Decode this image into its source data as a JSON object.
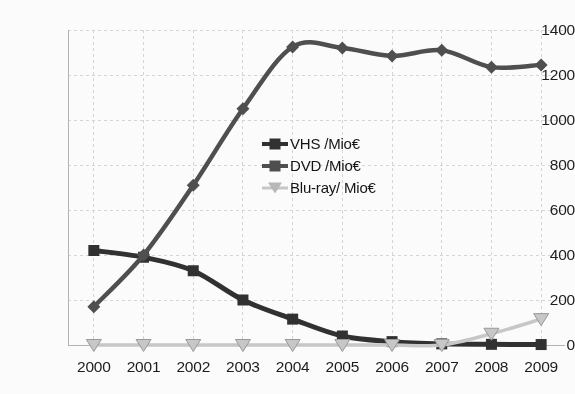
{
  "chart_data": {
    "type": "line",
    "title": "",
    "subtitle": "",
    "xlabel": "",
    "ylabel": "",
    "categories": [
      "2000",
      "2001",
      "2002",
      "2003",
      "2004",
      "2005",
      "2006",
      "2007",
      "2008",
      "2009"
    ],
    "x": [
      2000,
      2001,
      2002,
      2003,
      2004,
      2005,
      2006,
      2007,
      2008,
      2009
    ],
    "ylim": [
      0,
      1400
    ],
    "yticks": [
      0,
      200,
      400,
      600,
      800,
      1000,
      1200,
      1400
    ],
    "ytick_labels": [
      "0",
      "200",
      "400",
      "600",
      "800",
      "1000",
      "1200",
      "1400"
    ],
    "grid": true,
    "grid_axis": "both",
    "legend_position": "center",
    "series": [
      {
        "name": "VHS /Mio€",
        "marker": "square",
        "color": "#2f2f2f",
        "values": [
          420,
          390,
          330,
          200,
          115,
          40,
          15,
          5,
          3,
          2
        ]
      },
      {
        "name": "DVD /Mio€",
        "marker": "diamond",
        "color": "#4d4d4d",
        "values": [
          170,
          400,
          710,
          1050,
          1325,
          1320,
          1285,
          1310,
          1235,
          1245
        ]
      },
      {
        "name": "Blu-ray/ Mio€",
        "marker": "triangle-down",
        "color": "#c9c9c9",
        "values": [
          0,
          0,
          0,
          0,
          0,
          0,
          0,
          0,
          50,
          115
        ]
      }
    ]
  },
  "axes": {
    "y_tick_labels": [
      "1400",
      "1200",
      "1000",
      "800",
      "600",
      "400",
      "200",
      "0"
    ],
    "x_tick_labels": [
      "2000",
      "2001",
      "2002",
      "2003",
      "2004",
      "2005",
      "2006",
      "2007",
      "2008",
      "2009"
    ]
  },
  "legend": {
    "items": [
      {
        "label": "VHS /Mio€",
        "marker": "square-icon",
        "color": "#2f2f2f"
      },
      {
        "label": "DVD /Mio€",
        "marker": "diamond-icon",
        "color": "#4d4d4d"
      },
      {
        "label": "Blu-ray/ Mio€",
        "marker": "triangle-down-icon",
        "color": "#c9c9c9"
      }
    ]
  },
  "colors": {
    "background": "#ffffff",
    "grid": "#d8d8d8",
    "axis": "#b5b5b5",
    "text": "#1a1a1a",
    "vhs": "#2f2f2f",
    "dvd": "#4d4d4d",
    "bluray": "#c9c9c9"
  }
}
